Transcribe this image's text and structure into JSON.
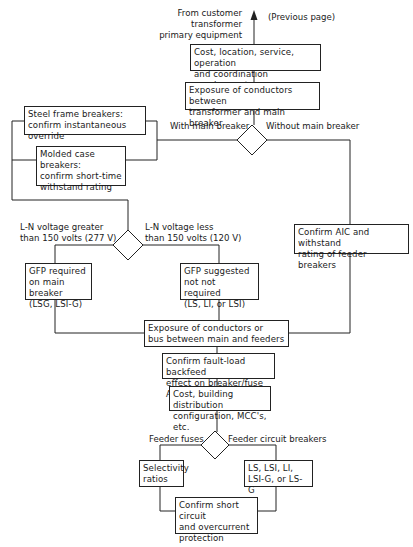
{
  "top": {
    "source_label": "From customer transformer\nprimary equipment",
    "previous_page": "(Previous page)"
  },
  "boxes": {
    "cost_location": "Cost, location, service, operation\nand coordination requirements",
    "exposure_transformer": "Exposure of conductors between\ntransformer and main breaker",
    "steel_frame": "Steel frame breakers:\nconfirm instantaneous override",
    "molded_case": "Molded case breakers:\nconfirm short-time\nwithstand rating",
    "gfp_required": "GFP required\non main breaker\n(LSG, LSI-G)",
    "gfp_suggested": "GFP suggested\nnot not required\n(LS, LI, or LSI)",
    "confirm_aic": "Confirm AIC and withstand\nrating of feeder breakers",
    "exposure_bus": "Exposure of conductors or\nbus between main and feeders",
    "fault_load": "Confirm fault-load backfeed\neffect on breaker/fuse AIC",
    "cost_building": "Cost, building distribution\nconfiguration, MCC's, etc.",
    "selectivity": "Selectivity\nratios",
    "ls_options": "LS, LSI, LI,\nLSI-G, or LS-G",
    "confirm_short": "Confirm short circuit\nand overcurrent\nprotection"
  },
  "decisions": {
    "main_breaker": {
      "left": "With main breaker",
      "right": "Without main breaker"
    },
    "voltage": {
      "left": "L-N voltage greater\nthan 150 volts (277 V)",
      "right": "L-N voltage less\nthan 150 volts (120 V)"
    },
    "feeder": {
      "left": "Feeder fuses",
      "right": "Feeder circuit breakers"
    }
  }
}
